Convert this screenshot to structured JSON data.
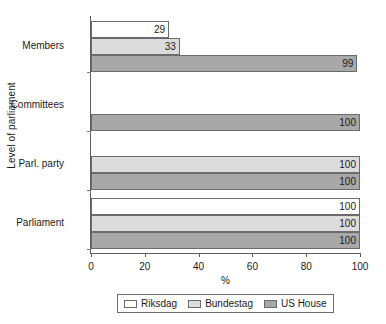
{
  "chart_data": {
    "type": "bar",
    "orientation": "horizontal",
    "title": "",
    "xlabel": "%",
    "ylabel": "Level of parliament",
    "xlim": [
      0,
      100
    ],
    "xticks": [
      0,
      20,
      40,
      60,
      80,
      100
    ],
    "xtick_labels": [
      "0",
      "20",
      "40",
      "60",
      "80",
      "100"
    ],
    "grid": false,
    "legend_position": "bottom",
    "categories": [
      "Members",
      "Committees",
      "Parl. party",
      "Parliament"
    ],
    "series": [
      {
        "name": "Riksdag",
        "color": "#ffffff",
        "values": [
          29,
          0,
          0,
          100
        ],
        "labels": [
          "29",
          "",
          "",
          "100"
        ]
      },
      {
        "name": "Bundestag",
        "color": "#dcdcdc",
        "values": [
          33,
          0,
          100,
          100
        ],
        "labels": [
          "33",
          "",
          "100",
          "100"
        ]
      },
      {
        "name": "US House",
        "color": "#a8a8a8",
        "values": [
          99,
          100,
          100,
          100
        ],
        "labels": [
          "99",
          "100",
          "100",
          "100"
        ]
      }
    ]
  },
  "legend": {
    "items": [
      {
        "label": "Riksdag"
      },
      {
        "label": "Bundestag"
      },
      {
        "label": "US House"
      }
    ]
  }
}
